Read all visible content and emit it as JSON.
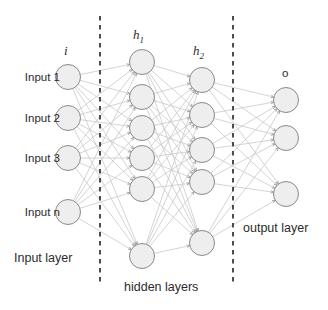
{
  "figure": {
    "type": "neural-network-diagram",
    "width": 328,
    "height": 310,
    "background": "#ffffff"
  },
  "style": {
    "node_fill": "#eeeeee",
    "node_stroke": "#8a8a8a",
    "edge_color": "#c9c9c9",
    "divider_color": "#3a3a3a",
    "text_color": "#2b2b2b",
    "node_radius": 12.5
  },
  "layer_titles": {
    "input": "i",
    "hidden1": "h",
    "hidden1_sub": "1",
    "hidden2": "h",
    "hidden2_sub": "2",
    "output": "o"
  },
  "section_labels": {
    "input_layer": "Input layer",
    "hidden_layers": "hidden layers",
    "output_layer": "output layer"
  },
  "input_labels": [
    "Input 1",
    "Input 2",
    "Input 3",
    "Input n"
  ],
  "chart_data": {
    "type": "diagram",
    "title": "",
    "layers": [
      {
        "id": "input",
        "name": "i",
        "label": "Input layer",
        "count": 4,
        "node_labels": [
          "Input 1",
          "Input 2",
          "Input 3",
          "Input n"
        ],
        "nodes": [
          {
            "cx": 68,
            "cy": 77
          },
          {
            "cx": 68,
            "cy": 118
          },
          {
            "cx": 68,
            "cy": 158
          },
          {
            "cx": 68,
            "cy": 212
          }
        ],
        "title_pos": {
          "x": 68,
          "y": 50
        }
      },
      {
        "id": "hidden1",
        "name": "h1",
        "label": "hidden layers",
        "count": 6,
        "nodes": [
          {
            "cx": 142,
            "cy": 62
          },
          {
            "cx": 142,
            "cy": 97
          },
          {
            "cx": 142,
            "cy": 128
          },
          {
            "cx": 142,
            "cy": 158
          },
          {
            "cx": 142,
            "cy": 189
          },
          {
            "cx": 142,
            "cy": 256
          }
        ],
        "title_pos": {
          "x": 142,
          "y": 36
        }
      },
      {
        "id": "hidden2",
        "name": "h2",
        "label": "hidden layers",
        "count": 5,
        "nodes": [
          {
            "cx": 202,
            "cy": 80
          },
          {
            "cx": 202,
            "cy": 115
          },
          {
            "cx": 202,
            "cy": 150
          },
          {
            "cx": 202,
            "cy": 182
          },
          {
            "cx": 202,
            "cy": 243
          }
        ],
        "title_pos": {
          "x": 202,
          "y": 52
        }
      },
      {
        "id": "output",
        "name": "o",
        "label": "output layer",
        "count": 3,
        "nodes": [
          {
            "cx": 286,
            "cy": 100
          },
          {
            "cx": 286,
            "cy": 138
          },
          {
            "cx": 286,
            "cy": 194
          }
        ],
        "title_pos": {
          "x": 286,
          "y": 74
        }
      }
    ],
    "connections": [
      {
        "from": "input",
        "to": "hidden1",
        "style": "fully-connected"
      },
      {
        "from": "hidden1",
        "to": "hidden2",
        "style": "fully-connected"
      },
      {
        "from": "hidden2",
        "to": "output",
        "style": "fully-connected"
      }
    ],
    "dividers": [
      {
        "id": "divider-input-hidden",
        "x": 100,
        "y1": 16,
        "y2": 286
      },
      {
        "id": "divider-hidden-output",
        "x": 233,
        "y1": 16,
        "y2": 286
      }
    ],
    "annotations": [
      {
        "text": "Input layer",
        "x": 14,
        "y": 258
      },
      {
        "text": "hidden layers",
        "x": 124,
        "y": 287
      },
      {
        "text": "output layer",
        "x": 243,
        "y": 228
      }
    ]
  }
}
